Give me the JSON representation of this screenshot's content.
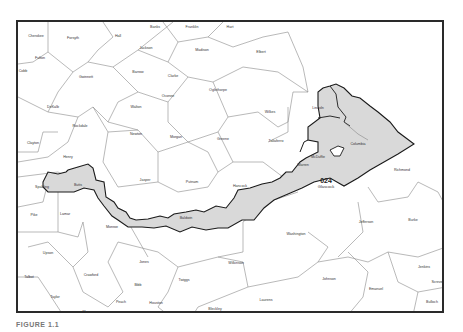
{
  "figure": {
    "caption": "FIGURE 1.1",
    "district": {
      "number": "024",
      "name": "Glascock"
    },
    "colors": {
      "district_fill": "#d9d9d9",
      "district_border": "#1a1a1a",
      "county_border": "#8a8a8a",
      "frame": "#2a2a2a"
    }
  },
  "counties": [
    {
      "name": "Cherokee",
      "x": 18,
      "y": 14
    },
    {
      "name": "Forsyth",
      "x": 55,
      "y": 16
    },
    {
      "name": "Hall",
      "x": 100,
      "y": 14
    },
    {
      "name": "Banks",
      "x": 137,
      "y": 5
    },
    {
      "name": "Franklin",
      "x": 174,
      "y": 5
    },
    {
      "name": "Hart",
      "x": 212,
      "y": 5
    },
    {
      "name": "Fulton",
      "x": 22,
      "y": 36
    },
    {
      "name": "Jackson",
      "x": 128,
      "y": 26
    },
    {
      "name": "Madison",
      "x": 184,
      "y": 28
    },
    {
      "name": "Elbert",
      "x": 243,
      "y": 30
    },
    {
      "name": "Cobb",
      "x": 5,
      "y": 49
    },
    {
      "name": "Barrow",
      "x": 120,
      "y": 50
    },
    {
      "name": "Gwinnett",
      "x": 68,
      "y": 55
    },
    {
      "name": "Clarke",
      "x": 155,
      "y": 54
    },
    {
      "name": "Oconee",
      "x": 150,
      "y": 74
    },
    {
      "name": "Oglethorpe",
      "x": 200,
      "y": 68
    },
    {
      "name": "Wilkes",
      "x": 252,
      "y": 90
    },
    {
      "name": "Lincoln",
      "x": 300,
      "y": 86
    },
    {
      "name": "DeKalb",
      "x": 35,
      "y": 85
    },
    {
      "name": "Walton",
      "x": 118,
      "y": 85
    },
    {
      "name": "Rockdale",
      "x": 62,
      "y": 104
    },
    {
      "name": "Newton",
      "x": 118,
      "y": 112
    },
    {
      "name": "Morgan",
      "x": 158,
      "y": 115
    },
    {
      "name": "Greene",
      "x": 205,
      "y": 117
    },
    {
      "name": "Taliaferro",
      "x": 258,
      "y": 119
    },
    {
      "name": "Columbia",
      "x": 340,
      "y": 122
    },
    {
      "name": "Clayton",
      "x": 15,
      "y": 121
    },
    {
      "name": "Henry",
      "x": 50,
      "y": 135
    },
    {
      "name": "Warren",
      "x": 285,
      "y": 143
    },
    {
      "name": "McDuffie",
      "x": 300,
      "y": 135
    },
    {
      "name": "Richmond",
      "x": 384,
      "y": 148
    },
    {
      "name": "Jasper",
      "x": 127,
      "y": 158
    },
    {
      "name": "Putnam",
      "x": 174,
      "y": 160
    },
    {
      "name": "Hancock",
      "x": 222,
      "y": 164
    },
    {
      "name": "Spalding",
      "x": 24,
      "y": 165
    },
    {
      "name": "Butts",
      "x": 60,
      "y": 163
    },
    {
      "name": "Pike",
      "x": 16,
      "y": 193
    },
    {
      "name": "Lamar",
      "x": 47,
      "y": 192
    },
    {
      "name": "Monroe",
      "x": 94,
      "y": 205
    },
    {
      "name": "Baldwin",
      "x": 168,
      "y": 196
    },
    {
      "name": "Washington",
      "x": 278,
      "y": 212
    },
    {
      "name": "Jefferson",
      "x": 348,
      "y": 200
    },
    {
      "name": "Burke",
      "x": 395,
      "y": 198
    },
    {
      "name": "Upson",
      "x": 30,
      "y": 231
    },
    {
      "name": "Jones",
      "x": 126,
      "y": 240
    },
    {
      "name": "Wilkinson",
      "x": 218,
      "y": 241
    },
    {
      "name": "Twiggs",
      "x": 166,
      "y": 258
    },
    {
      "name": "Jenkins",
      "x": 406,
      "y": 245
    },
    {
      "name": "Emanuel",
      "x": 358,
      "y": 267
    },
    {
      "name": "Johnson",
      "x": 311,
      "y": 257
    },
    {
      "name": "Crawford",
      "x": 73,
      "y": 253
    },
    {
      "name": "Bibb",
      "x": 120,
      "y": 263
    },
    {
      "name": "Talbot",
      "x": 11,
      "y": 255
    },
    {
      "name": "Taylor",
      "x": 37,
      "y": 275
    },
    {
      "name": "Laurens",
      "x": 248,
      "y": 278
    },
    {
      "name": "Bleckley",
      "x": 197,
      "y": 287
    },
    {
      "name": "Houston",
      "x": 138,
      "y": 281
    },
    {
      "name": "Peach",
      "x": 103,
      "y": 280
    },
    {
      "name": "Treutlen",
      "x": 313,
      "y": 292
    },
    {
      "name": "Screven",
      "x": 420,
      "y": 260
    },
    {
      "name": "Bulloch",
      "x": 414,
      "y": 280
    },
    {
      "name": "Macon",
      "x": 70,
      "y": 290
    },
    {
      "name": "Schley",
      "x": 6,
      "y": 291
    }
  ]
}
